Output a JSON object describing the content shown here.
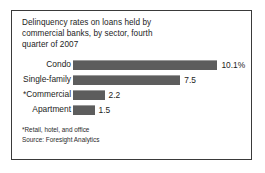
{
  "figure": {
    "title_lines": [
      "Delinquency rates on loans held by",
      "commercial banks, by sector, fourth",
      "quarter of 2007"
    ],
    "footnote": "*Retail, hotel, and office",
    "source": "Source: Foresight Analytics",
    "bar_color": "#5d5d5d",
    "border_color": "#3a3a3a",
    "background_color": "#ffffff"
  },
  "chart_data": {
    "type": "bar",
    "orientation": "horizontal",
    "title": "Delinquency rates on loans held by commercial banks, by sector, fourth quarter of 2007",
    "xlabel": "",
    "ylabel": "",
    "grid": false,
    "legend": "none",
    "xlim": [
      0,
      10.1
    ],
    "categories": [
      "Condo",
      "Single-family",
      "*Commercial",
      "Apartment"
    ],
    "values": [
      10.1,
      7.5,
      2.2,
      1.5
    ],
    "value_labels": [
      "10.1%",
      "7.5",
      "2.2",
      "1.5"
    ],
    "px_per_unit": 14.3,
    "annotations": [
      "*Retail, hotel, and office",
      "Source: Foresight Analytics"
    ]
  }
}
